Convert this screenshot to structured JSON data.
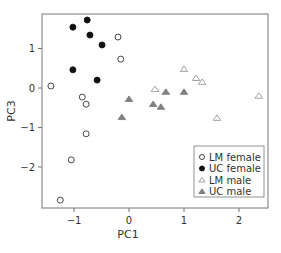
{
  "chart_data": {
    "type": "scatter",
    "title": "",
    "xlabel": "PC1",
    "ylabel": "PC3",
    "xlim": [
      -1.6,
      2.54
    ],
    "ylim": [
      -3.05,
      1.88
    ],
    "xticks": [
      -1,
      0,
      1,
      2
    ],
    "yticks": [
      -2,
      -1,
      0,
      1
    ],
    "xtick_labels": [
      "−1",
      "0",
      "1",
      "2"
    ],
    "ytick_labels": [
      "−2",
      "−1",
      "0",
      "1"
    ],
    "grid": false,
    "legend_position": "lower right",
    "series": [
      {
        "name": "LM female",
        "marker": "open-circle",
        "color": "#333333",
        "points": [
          [
            -0.2,
            1.29
          ],
          [
            -0.15,
            0.73
          ],
          [
            -1.42,
            0.05
          ],
          [
            -0.85,
            -0.23
          ],
          [
            -0.78,
            -0.41
          ],
          [
            -0.78,
            -1.16
          ],
          [
            -1.05,
            -1.82
          ],
          [
            -1.25,
            -2.84
          ]
        ]
      },
      {
        "name": "UC female",
        "marker": "filled-circle",
        "color": "#111111",
        "points": [
          [
            -0.76,
            1.72
          ],
          [
            -1.02,
            1.54
          ],
          [
            -0.71,
            1.34
          ],
          [
            -0.49,
            1.09
          ],
          [
            -1.02,
            0.46
          ],
          [
            -0.58,
            0.2
          ]
        ]
      },
      {
        "name": "LM male",
        "marker": "open-triangle",
        "color": "#999999",
        "points": [
          [
            0.47,
            -0.03
          ],
          [
            1.0,
            0.48
          ],
          [
            1.22,
            0.25
          ],
          [
            1.33,
            0.15
          ],
          [
            2.36,
            -0.2
          ],
          [
            1.6,
            -0.76
          ]
        ]
      },
      {
        "name": "UC male",
        "marker": "filled-triangle",
        "color": "#808080",
        "points": [
          [
            0.67,
            -0.1
          ],
          [
            1.0,
            -0.1
          ],
          [
            0.0,
            -0.28
          ],
          [
            0.44,
            -0.41
          ],
          [
            0.58,
            -0.48
          ],
          [
            -0.13,
            -0.74
          ]
        ]
      }
    ]
  },
  "legend": {
    "items": [
      "LM female",
      "UC female",
      "LM male",
      "UC male"
    ]
  }
}
